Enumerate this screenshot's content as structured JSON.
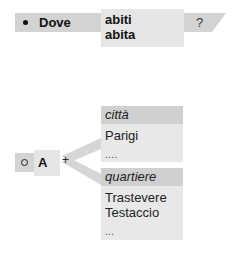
{
  "top_row": {
    "bullet_icon": "filled-circle",
    "label": "Dove",
    "verbs": [
      "abiti",
      "abita"
    ],
    "question": "?"
  },
  "bottom_row": {
    "bullet_icon": "hollow-circle",
    "label": "A",
    "connector": "+",
    "panels": [
      {
        "header": "città",
        "items": [
          "Parigi",
          "...."
        ]
      },
      {
        "header": "quartiere",
        "items": [
          "Trastevere",
          "Testaccio",
          "..."
        ]
      }
    ]
  },
  "colors": {
    "dark_fill": "#d3d3d3",
    "light_fill": "#e6e6e6",
    "header_fill": "#d0d0d0",
    "connector": "#d6d6d6"
  }
}
